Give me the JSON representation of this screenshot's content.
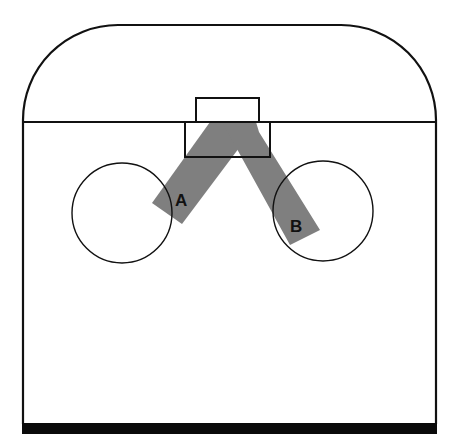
{
  "diagram": {
    "labels": {
      "beam_a": "A",
      "beam_b": "B"
    },
    "colors": {
      "stroke": "#111111",
      "beam": "#7f7f7f",
      "background": "#ffffff",
      "base": "#0a0a0a"
    },
    "parts": [
      "enclosure-outline",
      "divider-line",
      "top-small-box",
      "source-box",
      "left-circle",
      "right-circle",
      "beam-a",
      "beam-b",
      "base-bar"
    ]
  }
}
